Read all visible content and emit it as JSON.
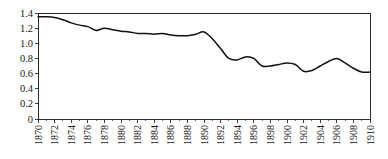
{
  "chart_data": {
    "type": "line",
    "title": "",
    "xlabel": "",
    "ylabel": "",
    "xlim": [
      1870,
      1910
    ],
    "ylim": [
      0,
      1.4
    ],
    "grid": false,
    "legend": null,
    "line_color": "#111111",
    "background_color": "#ffffff",
    "axis_color": "#2b2b2b",
    "y_ticks": [
      "0",
      "0.2",
      "0.4",
      "0.6",
      "0.8",
      "1.0",
      "1.2",
      "1.4"
    ],
    "y_tick_values": [
      0,
      0.2,
      0.4,
      0.6,
      0.8,
      1.0,
      1.2,
      1.4
    ],
    "x_ticks": [
      "1870",
      "1872",
      "1874",
      "1876",
      "1878",
      "1880",
      "1882",
      "1884",
      "1886",
      "1888",
      "1890",
      "1892",
      "1894",
      "1896",
      "1898",
      "1900",
      "1902",
      "1904",
      "1906",
      "1908",
      "1910"
    ],
    "x_tick_values": [
      1870,
      1872,
      1874,
      1876,
      1878,
      1880,
      1882,
      1884,
      1886,
      1888,
      1890,
      1892,
      1894,
      1896,
      1898,
      1900,
      1902,
      1904,
      1906,
      1908,
      1910
    ],
    "x_tick_rotation": 90,
    "x": [
      1870,
      1871,
      1872,
      1873,
      1874,
      1875,
      1876,
      1877,
      1878,
      1879,
      1880,
      1881,
      1882,
      1883,
      1884,
      1885,
      1886,
      1887,
      1888,
      1889,
      1890,
      1891,
      1892,
      1893,
      1894,
      1895,
      1896,
      1897,
      1898,
      1899,
      1900,
      1901,
      1902,
      1903,
      1904,
      1905,
      1906,
      1907,
      1908,
      1909,
      1910
    ],
    "values": [
      1.35,
      1.35,
      1.34,
      1.31,
      1.27,
      1.24,
      1.22,
      1.17,
      1.2,
      1.18,
      1.16,
      1.15,
      1.13,
      1.13,
      1.12,
      1.13,
      1.11,
      1.1,
      1.1,
      1.12,
      1.15,
      1.06,
      0.93,
      0.8,
      0.78,
      0.82,
      0.8,
      0.7,
      0.7,
      0.72,
      0.74,
      0.72,
      0.63,
      0.64,
      0.7,
      0.76,
      0.8,
      0.74,
      0.67,
      0.62,
      0.62
    ]
  }
}
